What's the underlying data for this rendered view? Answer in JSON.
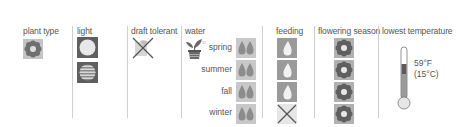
{
  "columns": {
    "plant_type": {
      "label": "plant type",
      "icon": "flower-icon"
    },
    "light": {
      "label": "light",
      "icons": [
        "full-sun-icon",
        "partial-shade-icon"
      ]
    },
    "draft_tolerant": {
      "label": "draft tolerant",
      "icon": "not-draft-tolerant-icon"
    },
    "water": {
      "label": "water",
      "icon": "potted-plant-icon",
      "rows": [
        {
          "season": "spring",
          "level": "two-drops"
        },
        {
          "season": "summer",
          "level": "two-drops"
        },
        {
          "season": "fall",
          "level": "two-drops"
        },
        {
          "season": "winter",
          "level": "two-drops"
        }
      ]
    },
    "feeding": {
      "label": "feeding",
      "rows": [
        {
          "season": "spring",
          "value": "feed"
        },
        {
          "season": "summer",
          "value": "feed"
        },
        {
          "season": "fall",
          "value": "feed"
        },
        {
          "season": "winter",
          "value": "none"
        }
      ]
    },
    "flowering_season": {
      "label": "flowering season",
      "rows": [
        {
          "season": "spring",
          "value": "flowers"
        },
        {
          "season": "summer",
          "value": "flowers"
        },
        {
          "season": "fall",
          "value": "flowers"
        },
        {
          "season": "winter",
          "value": "flowers"
        }
      ]
    },
    "lowest_temperature": {
      "label": "lowest temperature",
      "fahrenheit": "59°F",
      "celsius": "(15°C)"
    }
  },
  "colors": {
    "icon_bg": "#b5b5b5",
    "icon_dark": "#6f6f6f",
    "drop_fill": "#909090",
    "divider": "#cfcfcf",
    "text": "#555555"
  }
}
